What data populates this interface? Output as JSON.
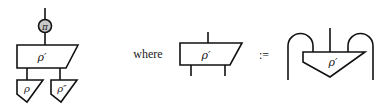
{
  "left_diagram": {
    "top_node": {
      "label": "π",
      "shape": "circle",
      "fill": "#c8c8c8"
    },
    "middle_node": {
      "label": "ρ′",
      "shape": "trapezoid-slanted-right"
    },
    "bottom_left_node": {
      "label": "ρ",
      "shape": "inverted-triangle"
    },
    "bottom_right_node": {
      "label": "ρ″",
      "shape": "inverted-triangle"
    }
  },
  "connector_word": "where",
  "middle_diagram": {
    "node": {
      "label": "ρ′",
      "shape": "trapezoid-slanted-right",
      "inputs": 1,
      "outputs": 2
    }
  },
  "definition_symbol": ":=",
  "right_diagram": {
    "node": {
      "label": "ρ′",
      "shape": "inverted-triangle"
    },
    "caps": [
      "left-cup-arc",
      "right-cup-arc"
    ]
  }
}
